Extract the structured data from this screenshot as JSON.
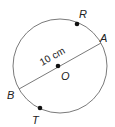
{
  "diagram": {
    "type": "circle-geometry",
    "circle": {
      "center_label": "O",
      "stroke": "#777777"
    },
    "diameter": {
      "from": "B",
      "to": "A",
      "measurement": "10 cm"
    },
    "points": [
      {
        "label": "R",
        "on": "circle",
        "marked": true
      },
      {
        "label": "A",
        "on": "circle",
        "marked": false
      },
      {
        "label": "O",
        "on": "center",
        "marked": true
      },
      {
        "label": "B",
        "on": "circle",
        "marked": false
      },
      {
        "label": "T",
        "on": "circle",
        "marked": true
      }
    ],
    "labels": {
      "R": "R",
      "A": "A",
      "O": "O",
      "B": "B",
      "T": "T",
      "measurement": "10 cm"
    }
  }
}
